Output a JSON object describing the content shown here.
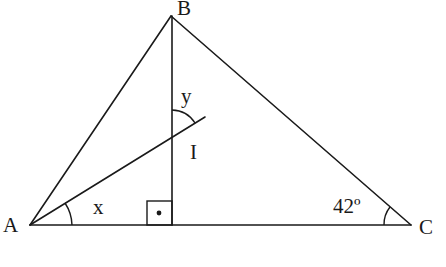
{
  "diagram": {
    "type": "geometry-triangle",
    "vertices": {
      "A": {
        "label": "A",
        "x": 30,
        "y": 225
      },
      "B": {
        "label": "B",
        "x": 171,
        "y": 16
      },
      "C": {
        "label": "C",
        "x": 411,
        "y": 225
      }
    },
    "altitude_foot": {
      "x": 172,
      "y": 225
    },
    "intersection": {
      "label": "I",
      "x": 172,
      "y": 138
    },
    "bisector_end": {
      "x": 205,
      "y": 117
    },
    "angles": {
      "at_A": {
        "label": "x"
      },
      "at_B_I": {
        "label": "y"
      },
      "at_C": {
        "label": "42º"
      }
    },
    "right_angle_marker": {
      "symbol": "•"
    },
    "stroke_color": "#1a1a1a",
    "background": "#ffffff"
  }
}
